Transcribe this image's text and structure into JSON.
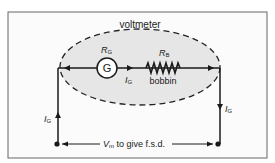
{
  "diagram": {
    "title": "voltmeter",
    "galvanometer": {
      "symbol": "G",
      "resistance_label": "R",
      "resistance_sub": "G"
    },
    "bobbin": {
      "resistance_label": "R",
      "resistance_sub": "B",
      "name": "bobbin"
    },
    "current_inner": {
      "label": "I",
      "sub": "G"
    },
    "current_left": {
      "label": "I",
      "sub": "G"
    },
    "current_right": {
      "label": "I",
      "sub": "G"
    },
    "voltage": {
      "label": "V",
      "sub": "m",
      "text": " to give f.s.d."
    },
    "colors": {
      "ellipse_fill": "#e6e6e6",
      "line": "#1a1a1a",
      "frame": "#555555"
    }
  }
}
